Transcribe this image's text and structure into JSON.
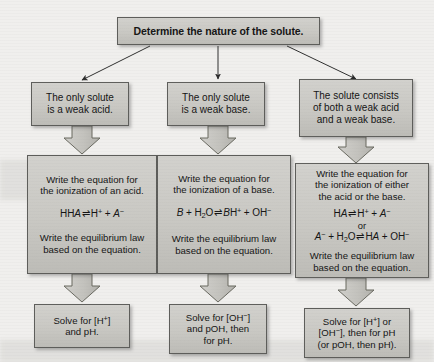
{
  "diagram": {
    "title_box": {
      "text": "Determine the nature of the solute."
    },
    "columns": [
      {
        "condition": {
          "line1": "The only solute",
          "line2": "is a weak acid."
        },
        "procedure": {
          "line1": "Write the equation for",
          "line2": "the ionization of an acid.",
          "equation1_left": "HA",
          "equation1_arrow": "⇌",
          "equation1_right_h": "H",
          "equation1_right_h_charge": "+",
          "equation1_plus": "+",
          "equation1_right_a": "A",
          "equation1_right_a_charge": "−",
          "line3": "Write the equilibrium law",
          "line4": "based on the equation."
        },
        "solve": {
          "line1_pre": "Solve for [H",
          "line1_charge": "+",
          "line1_post": "]",
          "line2": "and pH."
        }
      },
      {
        "condition": {
          "line1": "The only solute",
          "line2": "is a weak base."
        },
        "procedure": {
          "line1": "Write the equation for",
          "line2": "the ionization of a base.",
          "eq_b": "B",
          "eq_plus1": "+",
          "eq_h2o_h": "H",
          "eq_h2o_sub": "2",
          "eq_h2o_o": "O",
          "eq_arrow": "⇌",
          "eq_bh": "B",
          "eq_bh_h": "H",
          "eq_bh_charge": "+",
          "eq_plus2": "+",
          "eq_oh": "OH",
          "eq_oh_charge": "−",
          "line3": "Write the equilibrium law",
          "line4": "based on the equation."
        },
        "solve": {
          "line1_pre": "Solve for [OH",
          "line1_charge": "−",
          "line1_post": "]",
          "line2": "and pOH, then",
          "line3": "for pH."
        }
      },
      {
        "condition": {
          "line1": "The solute consists",
          "line2": "of both a weak acid",
          "line3": "and a weak base."
        },
        "procedure": {
          "line1": "Write the equation for",
          "line2": "the ionization of either",
          "line3": "the acid or the base.",
          "eq1_left": "HA",
          "eq1_arrow": "⇌",
          "eq1_h": "H",
          "eq1_h_charge": "+",
          "eq1_plus": "+",
          "eq1_a": "A",
          "eq1_a_charge": "−",
          "or_label": "or",
          "eq2_a": "A",
          "eq2_a_charge": "−",
          "eq2_plus1": "+",
          "eq2_h2o_h": "H",
          "eq2_h2o_sub": "2",
          "eq2_h2o_o": "O",
          "eq2_arrow": "⇌",
          "eq2_ha": "HA",
          "eq2_plus2": "+",
          "eq2_oh": "OH",
          "eq2_oh_charge": "−",
          "line4": "Write the equilibrium law",
          "line5": "based on the equation."
        },
        "solve": {
          "line1_pre": "Solve for [H",
          "line1_charge": "+",
          "line1_post": "] or",
          "line2_pre": "[OH",
          "line2_charge": "−",
          "line2_post": "], then for pH",
          "line3": "(or pOH, then pH)."
        }
      }
    ],
    "colors": {
      "box_fill": "#c9c8c3",
      "box_border": "#5d5d5a",
      "arrow_fill": "#c5c4bf",
      "arrow_border": "#6a6a67",
      "page_background": "#f0efed",
      "text": "#141414"
    }
  }
}
